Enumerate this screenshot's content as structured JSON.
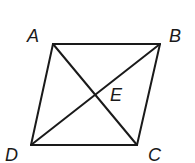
{
  "figure": {
    "type": "parallelogram-with-diagonals",
    "stroke_color": "#1a1a1a",
    "background": "#ffffff",
    "vertices": {
      "A": {
        "label": "A",
        "x": 53,
        "y": 44,
        "label_x": 27,
        "label_y": 42
      },
      "B": {
        "label": "B",
        "x": 160,
        "y": 44,
        "label_x": 169,
        "label_y": 42
      },
      "C": {
        "label": "C",
        "x": 137,
        "y": 145,
        "label_x": 148,
        "label_y": 161
      },
      "D": {
        "label": "D",
        "x": 31,
        "y": 145,
        "label_x": 5,
        "label_y": 161
      }
    },
    "intersection": {
      "label": "E",
      "x": 95,
      "y": 95,
      "label_x": 110,
      "label_y": 101
    },
    "sides": [
      "AB",
      "BC",
      "CD",
      "DA"
    ],
    "diagonals": [
      "AC",
      "BD"
    ]
  }
}
